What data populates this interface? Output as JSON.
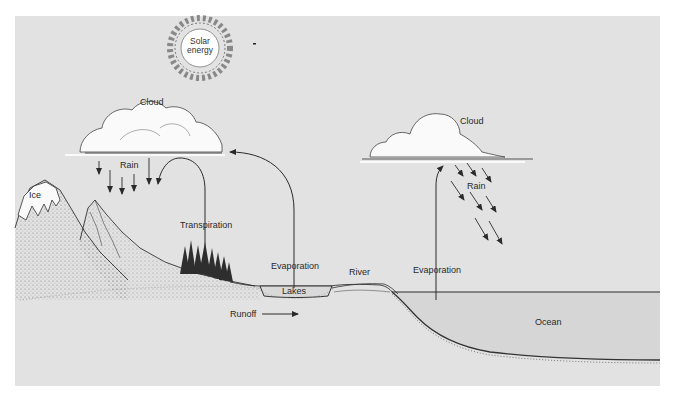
{
  "diagram": {
    "type": "water-cycle",
    "colors": {
      "background": "#e2e2e2",
      "page": "#ffffff",
      "ink": "#2a2a2a",
      "cloud": "#fafafa",
      "ocean": "#d6d6d6",
      "ground": "#e2e2e2"
    },
    "labels": {
      "solar": "Solar\nenergy",
      "solar_line1": "Solar",
      "solar_line2": "energy",
      "cloud_left": "Cloud",
      "cloud_right": "Cloud",
      "rain_left": "Rain",
      "rain_right": "Rain",
      "ice": "Ice",
      "transpiration": "Transpiration",
      "evaporation_lake": "Evaporation",
      "evaporation_ocean": "Evaporation",
      "lakes": "Lakes",
      "river": "River",
      "runoff": "Runoff",
      "ocean": "Ocean"
    },
    "nodes": [
      {
        "id": "sun",
        "label": "Solar energy"
      },
      {
        "id": "cloud-left",
        "label": "Cloud"
      },
      {
        "id": "cloud-right",
        "label": "Cloud"
      },
      {
        "id": "ice",
        "label": "Ice"
      },
      {
        "id": "forest",
        "label": "Transpiration"
      },
      {
        "id": "lakes",
        "label": "Lakes"
      },
      {
        "id": "river",
        "label": "River"
      },
      {
        "id": "ocean",
        "label": "Ocean"
      }
    ],
    "edges": [
      {
        "from": "cloud-left",
        "to": "ground",
        "label": "Rain"
      },
      {
        "from": "forest",
        "to": "cloud-left",
        "label": "Transpiration"
      },
      {
        "from": "lakes",
        "to": "cloud-left",
        "label": "Evaporation"
      },
      {
        "from": "ocean",
        "to": "cloud-right",
        "label": "Evaporation"
      },
      {
        "from": "cloud-right",
        "to": "ocean",
        "label": "Rain"
      },
      {
        "from": "mountains",
        "to": "lakes",
        "label": "Runoff"
      }
    ]
  }
}
